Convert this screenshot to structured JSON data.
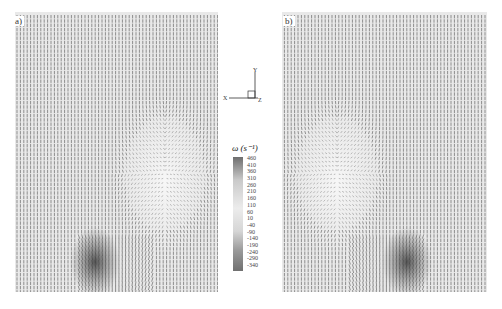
{
  "panels": [
    {
      "id": "a",
      "label": "a)"
    },
    {
      "id": "b",
      "label": "b)"
    }
  ],
  "axes_indicator": {
    "x_label": "X",
    "y_label": "Y",
    "z_label": "Z"
  },
  "colorbar": {
    "title": "ω (s⁻¹)",
    "ticks": [
      "460",
      "410",
      "360",
      "310",
      "260",
      "210",
      "160",
      "110",
      "60",
      "10",
      "-40",
      "-90",
      "-140",
      "-190",
      "-240",
      "-290",
      "-340"
    ],
    "min": -340,
    "max": 460,
    "colors": {
      "high": "#6e6e6e",
      "mid": "#ececec",
      "low": "#707070"
    }
  },
  "field": {
    "description": "velocity vector field with vorticity shading",
    "vector_color": "#3a3a3a",
    "background_color": "#e6e6e6"
  }
}
